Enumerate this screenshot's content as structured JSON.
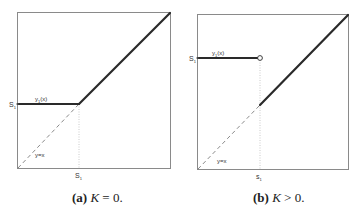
{
  "figures": [
    {
      "id": "a",
      "caption": {
        "tag": "(a)",
        "variable": "K",
        "relation": " = 0."
      },
      "labels": {
        "y_axis_mark": "S",
        "y_axis_mark_sub": "1",
        "x_axis_mark": "S",
        "x_axis_mark_sub": "1",
        "flat_curve": "y",
        "flat_curve_sub": "1",
        "flat_curve_arg": "(x)",
        "identity_line": "y=x"
      }
    },
    {
      "id": "b",
      "caption": {
        "tag": "(b)",
        "variable": "K",
        "relation": " > 0."
      },
      "labels": {
        "y_axis_mark": "S",
        "y_axis_mark_sub": "1",
        "x_axis_mark": "s",
        "x_axis_mark_sub": "1",
        "flat_curve": "y",
        "flat_curve_sub": "1",
        "flat_curve_arg": "(x)",
        "identity_line": "y=x"
      }
    }
  ],
  "colors": {
    "curve": "#2a2a2a",
    "frame": "#8a8a8a",
    "dashed": "#8a8a8a",
    "dotted": "#bdbdbd"
  }
}
